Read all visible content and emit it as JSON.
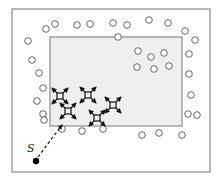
{
  "diagram": {
    "type": "particle-region-schematic",
    "source_label": "S",
    "colors": {
      "frame_border": "#8a8a8a",
      "region_fill": "#efefef",
      "region_border": "#8a8a8a",
      "particle_stroke": "#666666",
      "star_color": "#111111",
      "source_dot": "#000000"
    },
    "frame": {
      "x": 12,
      "y": 9,
      "w": 198,
      "h": 163
    },
    "region": {
      "x": 50,
      "y": 37,
      "w": 132,
      "h": 89
    },
    "source": {
      "x": 36,
      "y": 161,
      "label_x": 27,
      "label_y": 142
    },
    "dashed_path": {
      "x1": 38,
      "y1": 157,
      "x2": 62,
      "y2": 125
    },
    "outer_particles": [
      [
        46,
        29
      ],
      [
        55,
        24
      ],
      [
        77,
        25
      ],
      [
        90,
        24
      ],
      [
        113,
        23
      ],
      [
        127,
        25
      ],
      [
        149,
        20
      ],
      [
        168,
        23
      ],
      [
        185,
        31
      ],
      [
        195,
        40
      ],
      [
        28,
        41
      ],
      [
        32,
        60
      ],
      [
        39,
        73
      ],
      [
        43,
        88
      ],
      [
        37,
        101
      ],
      [
        43,
        114
      ],
      [
        44,
        120
      ],
      [
        62,
        129
      ],
      [
        82,
        131
      ],
      [
        103,
        129
      ],
      [
        142,
        135
      ],
      [
        159,
        133
      ],
      [
        182,
        135
      ],
      [
        188,
        114
      ],
      [
        197,
        115
      ],
      [
        191,
        95
      ],
      [
        189,
        74
      ],
      [
        189,
        54
      ]
    ],
    "inner_particles": [
      [
        138,
        51
      ],
      [
        151,
        57
      ],
      [
        164,
        53
      ],
      [
        137,
        67
      ],
      [
        154,
        69
      ],
      [
        169,
        66
      ],
      [
        118,
        37
      ]
    ],
    "stars": [
      {
        "x": 60,
        "y": 96
      },
      {
        "x": 88,
        "y": 95
      },
      {
        "x": 113,
        "y": 105
      },
      {
        "x": 68,
        "y": 111
      },
      {
        "x": 97,
        "y": 118
      }
    ]
  }
}
